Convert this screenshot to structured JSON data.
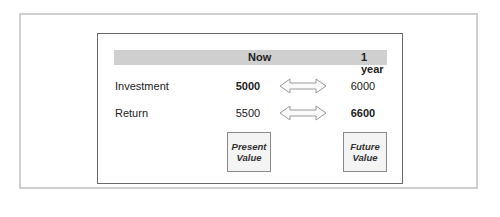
{
  "diagram": {
    "header": {
      "col_now": "Now",
      "col_future": "1 year"
    },
    "rows": [
      {
        "label": "Investment",
        "now": "5000",
        "future": "6000",
        "bold": "now"
      },
      {
        "label": "Return",
        "now": "5500",
        "future": "6600",
        "bold": "future"
      }
    ],
    "boxes": {
      "present": {
        "line1": "Present",
        "line2": "Value"
      },
      "future": {
        "line1": "Future",
        "line2": "Value"
      }
    },
    "arrow_icon": "double-headed-arrow",
    "colors": {
      "header_bar": "#cfcfcf",
      "frame": "#cfcfcf",
      "inner_border": "#6a6a6a",
      "box_fill": "#f4f4f4"
    }
  }
}
